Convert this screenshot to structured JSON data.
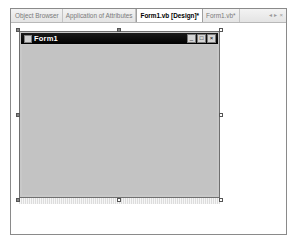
{
  "tabs": [
    {
      "label": "Object Browser",
      "active": false
    },
    {
      "label": "Application of Attributes",
      "active": false
    },
    {
      "label": "Form1.vb [Design]*",
      "active": true
    },
    {
      "label": "Form1.vb*",
      "active": false
    }
  ],
  "tab_controls": {
    "scroll_left": "◂",
    "scroll_right": "▸",
    "close": "×"
  },
  "form": {
    "title": "Form1",
    "caption_buttons": {
      "minimize": "_",
      "maximize": "□",
      "close": "×"
    },
    "colors": {
      "title_bar": "#000000",
      "client_area": "#c3c3c3",
      "grid_dot": "#8e8e8e"
    }
  }
}
